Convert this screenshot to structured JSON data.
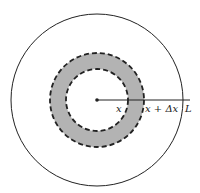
{
  "diagram": {
    "type": "concentric-circles-annulus",
    "center": {
      "x": 97,
      "y": 100
    },
    "outer_circle": {
      "radius": 86,
      "style": "solid"
    },
    "annulus": {
      "inner_radius": 31,
      "outer_radius": 47,
      "fill_color": "#b3b3b3",
      "border_style": "dashed"
    },
    "radial_line": {
      "from_x": 97,
      "to_x": 190,
      "y": 100
    },
    "labels": {
      "inner": "x",
      "outer": "x + Δx",
      "end": "L"
    },
    "colors": {
      "stroke": "#222222",
      "annulus_fill": "#b3b3b3",
      "background": "#ffffff"
    }
  }
}
